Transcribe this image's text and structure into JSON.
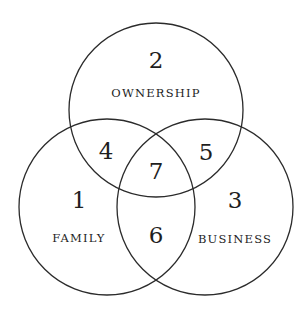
{
  "diagram": {
    "type": "venn",
    "stroke_color": "#2b2b2b",
    "text_color": "#1e1e1e",
    "sets": [
      {
        "id": "ownership",
        "label": "OWNERSHIP",
        "region_number": "2",
        "center": [
          156,
          110
        ],
        "radius": 87
      },
      {
        "id": "family",
        "label": "FAMILY",
        "region_number": "1",
        "center": [
          107,
          207
        ],
        "radius": 88
      },
      {
        "id": "business",
        "label": "BUSINESS",
        "region_number": "3",
        "center": [
          205,
          207
        ],
        "radius": 88
      }
    ],
    "regions": {
      "family_only": "1",
      "ownership_only": "2",
      "business_only": "3",
      "family_ownership": "4",
      "ownership_business": "5",
      "family_business": "6",
      "all_three": "7"
    }
  }
}
